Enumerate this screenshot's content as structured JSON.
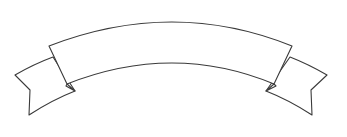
{
  "graphic": {
    "type": "ribbon-banner",
    "label": "",
    "stroke_color": "#3a3a3a",
    "fill_color": "#ffffff",
    "background": "#ffffff"
  }
}
